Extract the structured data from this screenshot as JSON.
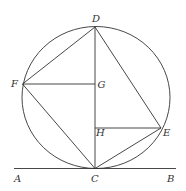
{
  "diagram": {
    "labels": {
      "A": "A",
      "B": "B",
      "C": "C",
      "D": "D",
      "E": "E",
      "F": "F",
      "G": "G",
      "H": "H"
    },
    "stroke_color": "#333333",
    "background": "#ffffff"
  }
}
